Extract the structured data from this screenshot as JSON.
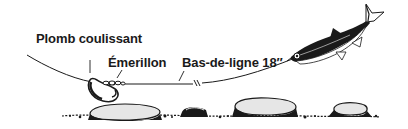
{
  "diagram": {
    "labels": {
      "sinker": "Plomb coulissant",
      "swivel": "Émerillon",
      "leader": "Bas-de-ligne 18″"
    },
    "colors": {
      "ink": "#1a1a1a",
      "background": "#ffffff",
      "rock_fill": "#e6e6e6"
    }
  }
}
